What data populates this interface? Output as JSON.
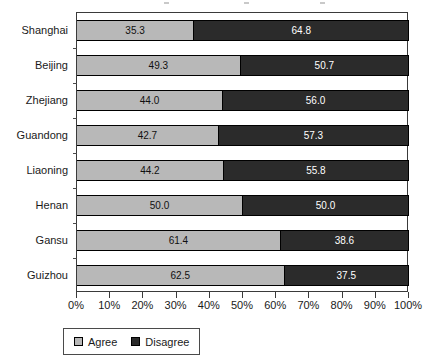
{
  "chart_data": {
    "type": "bar",
    "orientation": "horizontal",
    "stacked": true,
    "stack_total": 100,
    "title": "",
    "subtitle": "",
    "xlabel": "",
    "ylabel": "",
    "xlim": [
      0,
      100
    ],
    "grid": false,
    "legend_position": "bottom-left",
    "categories": [
      "Shanghai",
      "Beijing",
      "Zhejiang",
      "Guandong",
      "Liaoning",
      "Henan",
      "Gansu",
      "Guizhou"
    ],
    "x_tick_labels": [
      "0%",
      "10%",
      "20%",
      "30%",
      "40%",
      "50%",
      "60%",
      "70%",
      "80%",
      "90%",
      "100%"
    ],
    "x_tick_values": [
      0,
      10,
      20,
      30,
      40,
      50,
      60,
      70,
      80,
      90,
      100
    ],
    "series": [
      {
        "name": "Agree",
        "color": "#b8b8b8",
        "label_color": "#101010",
        "values": [
          35.3,
          49.3,
          44.0,
          42.7,
          44.2,
          50.0,
          61.4,
          62.5
        ],
        "labels": [
          "35.3",
          "49.3",
          "44.0",
          "42.7",
          "44.2",
          "50.0",
          "61.4",
          "62.5"
        ]
      },
      {
        "name": "Disagree",
        "color": "#2b2b2b",
        "label_color": "#ffffff",
        "values": [
          64.8,
          50.7,
          56.0,
          57.3,
          55.8,
          50.0,
          38.6,
          37.5
        ],
        "labels": [
          "64.8",
          "50.7",
          "56.0",
          "57.3",
          "55.8",
          "50.0",
          "38.6",
          "37.5"
        ]
      }
    ]
  },
  "legend": {
    "items": [
      {
        "label": "Agree",
        "color": "#b8b8b8"
      },
      {
        "label": "Disagree",
        "color": "#2b2b2b"
      }
    ]
  },
  "colors": {
    "agree": "#b8b8b8",
    "disagree": "#2b2b2b",
    "axis": "#3a3a3a",
    "text": "#1a1a1a",
    "background": "#ffffff"
  }
}
